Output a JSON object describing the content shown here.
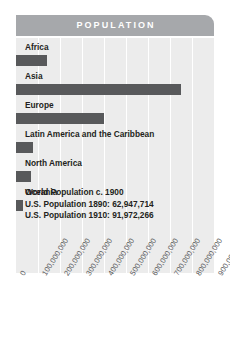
{
  "header": {
    "title": "POPULATION"
  },
  "colors": {
    "banner": "#a6a8ab",
    "plot_background": "#ececec",
    "bar": "#58595b",
    "gridline": "#ffffff",
    "label_text": "#231f20",
    "tick_text": "#58595b",
    "title_text": "#ffffff"
  },
  "annotation": {
    "line1": "World Population c. 1900",
    "line2": "U.S. Population 1890: 62,947,714",
    "line3": "U.S. Population 1910: 91,972,266"
  },
  "chart_data": {
    "type": "bar",
    "orientation": "horizontal",
    "title": "POPULATION",
    "xlabel": "",
    "ylabel": "",
    "categories": [
      "Africa",
      "Asia",
      "Europe",
      "Latin America and the Caribbean",
      "North America",
      "Oceania"
    ],
    "values": [
      140000000,
      750000000,
      400000000,
      75000000,
      70000000,
      30000000
    ],
    "xlim": [
      0,
      900000000
    ],
    "xticks": [
      0,
      100000000,
      200000000,
      300000000,
      400000000,
      500000000,
      600000000,
      700000000,
      800000000,
      900000000
    ],
    "xtick_labels": [
      "0",
      "100,000,000",
      "200,000,000",
      "300,000,000",
      "400,000,000",
      "500,000,000",
      "600,000,000",
      "700,000,000",
      "800,000,000",
      "900,000,000"
    ],
    "grid": true,
    "grid_axis": "x",
    "legend": false,
    "annotations": [
      "World Population c. 1900",
      "U.S. Population 1890: 62,947,714",
      "U.S. Population 1910: 91,972,266"
    ]
  }
}
